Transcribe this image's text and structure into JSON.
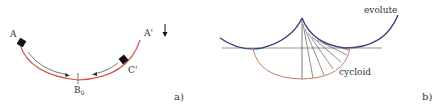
{
  "panel_a": {
    "labels": {
      "A": "A",
      "A_prime": "A'",
      "C_prime": "C'",
      "B0_main": "B",
      "B0_sub": "0",
      "caption": "a)"
    },
    "colors": {
      "track": "#d9534f",
      "motion_arrows": "#5a6f6a",
      "blocks": "#111111",
      "gravity_arrow": "#111111"
    }
  },
  "panel_b": {
    "labels": {
      "evolute": "evolute",
      "cycloid": "cycloid",
      "caption": "b)"
    },
    "colors": {
      "evolute": "#2f3d7a",
      "cycloid": "#c47a6a",
      "lines": "#444444"
    }
  }
}
